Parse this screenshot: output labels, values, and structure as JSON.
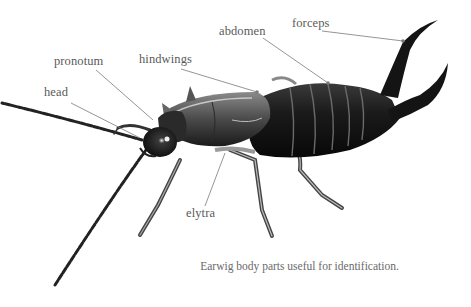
{
  "figure": {
    "subject": "earwig",
    "caption": "Earwig body parts useful for identification.",
    "labels": {
      "forceps": "forceps",
      "abdomen": "abdomen",
      "hindwings": "hindwings",
      "pronotum": "pronotum",
      "head": "head",
      "elytra": "elytra"
    },
    "colors": {
      "background": "#ffffff",
      "label_text": "#5a5a5a",
      "leader_line": "#7a7a7a",
      "body_dark": "#141414",
      "body_mid": "#4a4a4a",
      "body_light": "#9a9a9a"
    }
  }
}
